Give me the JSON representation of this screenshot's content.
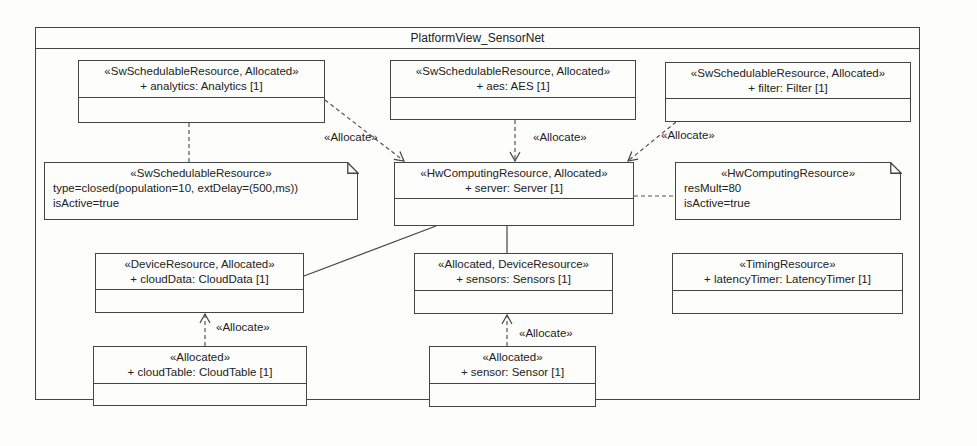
{
  "diagram": {
    "title": "PlatformView_SensorNet",
    "parts": [
      {
        "id": "analytics",
        "stereotype": "«SwSchedulableResource, Allocated»",
        "name": "+ analytics: Analytics [1]"
      },
      {
        "id": "aes",
        "stereotype": "«SwSchedulableResource, Allocated»",
        "name": "+ aes: AES [1]"
      },
      {
        "id": "filter",
        "stereotype": "«SwSchedulableResource, Allocated»",
        "name": "+ filter: Filter [1]"
      },
      {
        "id": "server",
        "stereotype": "«HwComputingResource, Allocated»",
        "name": "+ server: Server [1]"
      },
      {
        "id": "cloudData",
        "stereotype": "«DeviceResource, Allocated»",
        "name": "+ cloudData: CloudData [1]"
      },
      {
        "id": "sensors",
        "stereotype": "«Allocated, DeviceResource»",
        "name": "+ sensors: Sensors [1]"
      },
      {
        "id": "latencyTimer",
        "stereotype": "«TimingResource»",
        "name": "+ latencyTimer: LatencyTimer [1]"
      },
      {
        "id": "cloudTable",
        "stereotype": "«Allocated»",
        "name": "+ cloudTable: CloudTable [1]"
      },
      {
        "id": "sensor",
        "stereotype": "«Allocated»",
        "name": "+ sensor: Sensor [1]"
      }
    ],
    "notes": [
      {
        "id": "note-sw",
        "stereotype": "«SwSchedulableResource»",
        "lines": [
          "type=closed(population=10, extDelay=(500,ms))",
          "isActive=true"
        ]
      },
      {
        "id": "note-hw",
        "stereotype": "«HwComputingResource»",
        "lines": [
          "resMult=80",
          "isActive=true"
        ]
      }
    ],
    "relations": [
      {
        "type": "allocate",
        "from": "analytics",
        "to": "server",
        "label": "«Allocate»"
      },
      {
        "type": "allocate",
        "from": "aes",
        "to": "server",
        "label": "«Allocate»"
      },
      {
        "type": "allocate",
        "from": "filter",
        "to": "server",
        "label": "«Allocate»"
      },
      {
        "type": "allocate",
        "from": "cloudTable",
        "to": "cloudData",
        "label": "«Allocate»"
      },
      {
        "type": "allocate",
        "from": "sensor",
        "to": "sensors",
        "label": "«Allocate»"
      },
      {
        "type": "connector",
        "from": "server",
        "to": "cloudData"
      },
      {
        "type": "connector",
        "from": "server",
        "to": "sensors"
      },
      {
        "type": "note-anchor",
        "from": "note-sw",
        "to": "analytics"
      },
      {
        "type": "note-anchor",
        "from": "note-hw",
        "to": "server"
      }
    ]
  }
}
